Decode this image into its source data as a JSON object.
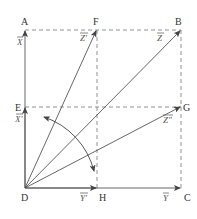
{
  "diagram": {
    "type": "vector-decomposition",
    "colors": {
      "line": "#555555",
      "dashed": "#777777",
      "text": "#333333",
      "background": "#ffffff"
    },
    "points": {
      "A": "A",
      "B": "B",
      "C": "C",
      "D": "D",
      "E": "E",
      "F": "F",
      "G": "G",
      "H": "H"
    },
    "vectors": {
      "X": "X",
      "X_prime": "X'",
      "Y": "Y",
      "Y_prime": "Y'",
      "Z": "Z",
      "Z_prime": "Z'",
      "Z_double_prime": "Z\""
    },
    "edges": [
      {
        "from": "D",
        "to": "A",
        "style": "solid-arrow",
        "label": "X"
      },
      {
        "from": "D",
        "to": "E",
        "style": "solid-arrow",
        "label": "X'"
      },
      {
        "from": "D",
        "to": "C",
        "style": "solid-arrow",
        "label": "Y"
      },
      {
        "from": "D",
        "to": "H",
        "style": "solid-arrow",
        "label": "Y'"
      },
      {
        "from": "D",
        "to": "B",
        "style": "solid-arrow",
        "label": "Z"
      },
      {
        "from": "D",
        "to": "F",
        "style": "solid-arrow",
        "label": "Z'"
      },
      {
        "from": "D",
        "to": "G",
        "style": "solid-arrow",
        "label": "Z\""
      },
      {
        "from": "A",
        "to": "B",
        "style": "dashed"
      },
      {
        "from": "B",
        "to": "C",
        "style": "dashed"
      },
      {
        "from": "E",
        "to": "G",
        "style": "dashed"
      },
      {
        "from": "F",
        "to": "H",
        "style": "dashed"
      }
    ],
    "rotation_arc": {
      "description": "double-headed curved arrow centered at D sweeping from near E toward near H"
    }
  }
}
